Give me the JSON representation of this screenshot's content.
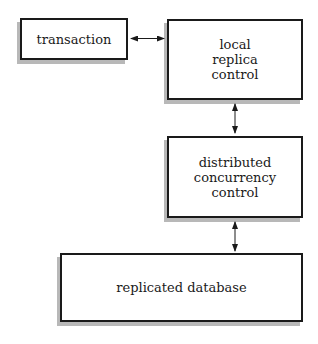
{
  "diagram": {
    "nodes": [
      {
        "id": "transaction",
        "label": "transaction"
      },
      {
        "id": "local_replica_control",
        "label": "local\nreplica\ncontrol"
      },
      {
        "id": "distributed_concurrency_control",
        "label": "distributed\nconcurrency\ncontrol"
      },
      {
        "id": "replicated_database",
        "label": "replicated database"
      }
    ],
    "edges": [
      {
        "from": "transaction",
        "to": "local_replica_control",
        "direction": "bidirectional"
      },
      {
        "from": "local_replica_control",
        "to": "distributed_concurrency_control",
        "direction": "bidirectional"
      },
      {
        "from": "distributed_concurrency_control",
        "to": "replicated_database",
        "direction": "bidirectional"
      }
    ]
  }
}
